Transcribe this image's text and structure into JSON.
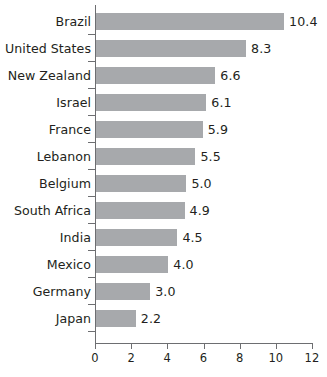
{
  "chart_data": {
    "type": "bar",
    "orientation": "horizontal",
    "title": "",
    "subtitle": "",
    "xlabel": "",
    "ylabel": "",
    "categories": [
      "Brazil",
      "United States",
      "New Zealand",
      "Israel",
      "France",
      "Lebanon",
      "Belgium",
      "South Africa",
      "India",
      "Mexico",
      "Germany",
      "Japan"
    ],
    "values": [
      10.4,
      8.3,
      6.6,
      6.1,
      5.9,
      5.5,
      5.0,
      4.9,
      4.5,
      4.0,
      3.0,
      2.2
    ],
    "value_labels": [
      "10.4",
      "8.3",
      "6.6",
      "6.1",
      "5.9",
      "5.5",
      "5.0",
      "4.9",
      "4.5",
      "4.0",
      "3.0",
      "2.2"
    ],
    "xlim": [
      0,
      12
    ],
    "xticks": [
      0,
      2,
      4,
      6,
      8,
      10,
      12
    ],
    "xtick_labels": [
      "0",
      "2",
      "4",
      "6",
      "8",
      "10",
      "12"
    ],
    "grid": false,
    "legend": null,
    "bar_color": "#a7a9ac",
    "axis_color": "#6d6e71",
    "text_color": "#231f20",
    "background_color": "#ffffff"
  }
}
